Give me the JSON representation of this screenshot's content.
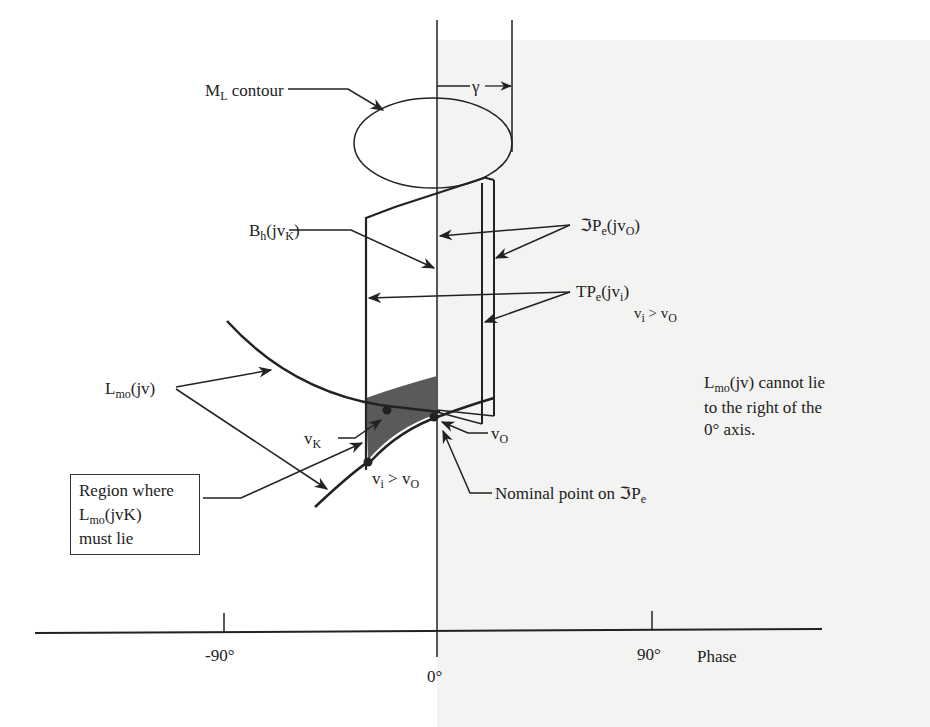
{
  "diagram": {
    "type": "nichols-chart-schematic",
    "axis": {
      "label": "Phase",
      "ticks": [
        "-90°",
        "0°",
        "90°"
      ]
    },
    "labels": {
      "ml_contour": "M",
      "ml_contour_sub": "L",
      "ml_contour_rest": " contour",
      "gamma": "γ",
      "bh": "B",
      "bh_sub": "h",
      "bh_paren": "(jv",
      "bh_paren_sub": "K",
      "bh_close": ")",
      "tpe_script": "ℑP",
      "tpe_script_sub": "e",
      "tpe_script_paren": "(jv",
      "tpe_script_paren_sub": "O",
      "tpe_script_close": ")",
      "tpe": "TP",
      "tpe_sub": "e",
      "tpe_paren": "(jv",
      "tpe_paren_sub": "i",
      "tpe_close": ")",
      "tpe_cond_v": "v",
      "tpe_cond_i": "i",
      "tpe_cond_gt": " > v",
      "tpe_cond_o": "O",
      "lmo": "L",
      "lmo_sub": "mo",
      "lmo_rest": "(jv)",
      "vk": "v",
      "vk_sub": "K",
      "vo": "v",
      "vo_sub": "O",
      "vi_cond_v": "v",
      "vi_cond_i": "i",
      "vi_cond_gt": " > v",
      "vi_cond_o": "O",
      "nominal": "Nominal point on ℑP",
      "nominal_sub": "e",
      "region_line1": "Region where",
      "region_line2_l": "L",
      "region_line2_sub": "mo",
      "region_line2_rest": "(jvK)",
      "region_line3": "must lie",
      "note_line1_l": "L",
      "note_line1_sub": "mo",
      "note_line1_rest": "(jv) cannot lie",
      "note_line2": "to the right of the",
      "note_line3": "0° axis."
    },
    "colors": {
      "ink": "#222222",
      "shaded_region": "#5a5a5a",
      "right_half_bg": "#f3f3f1"
    }
  }
}
